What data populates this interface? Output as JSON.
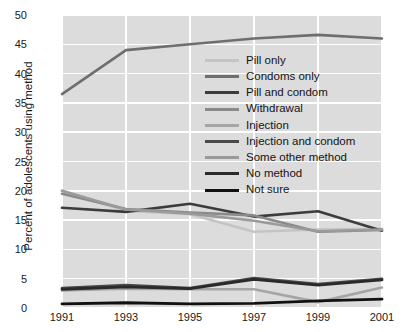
{
  "chart_data": {
    "type": "line",
    "title": "",
    "xlabel": "",
    "ylabel": "Percent of adolescents using method",
    "x": [
      1991,
      1993,
      1995,
      1997,
      1999,
      2001
    ],
    "xticklabels": [
      "1991",
      "1993",
      "1995",
      "1997",
      "1999",
      "2001"
    ],
    "yticklabels": [
      "0",
      "5",
      "10",
      "15",
      "20",
      "25",
      "30",
      "35",
      "40",
      "45",
      "50"
    ],
    "ylim": [
      0,
      50
    ],
    "ytick_step": 5,
    "xlim": [
      1991,
      2001
    ],
    "grid": true,
    "legend_position": "center-right",
    "plot_background": "#dcdcdc",
    "gridline_color": "#ffffff",
    "series": [
      {
        "name": "Pill only",
        "color": "#c4c4c4",
        "width": 2.6,
        "values": [
          20.0,
          16.6,
          16.0,
          13.0,
          13.4,
          13.5
        ]
      },
      {
        "name": "Condoms only",
        "color": "#6e6e6e",
        "width": 2.6,
        "values": [
          36.5,
          44.0,
          45.0,
          46.0,
          46.6,
          46.0
        ]
      },
      {
        "name": "Pill and condom",
        "color": "#3c3c3c",
        "width": 2.6,
        "values": [
          17.1,
          16.4,
          17.8,
          15.6,
          16.5,
          13.2
        ]
      },
      {
        "name": "Withdrawal",
        "color": "#8a8a8a",
        "width": 2.6,
        "values": [
          19.5,
          16.9,
          16.3,
          15.8,
          13.0,
          13.3
        ]
      },
      {
        "name": "Injection",
        "color": "#a5a5a5",
        "width": 2.6,
        "values": [
          3.0,
          3.3,
          3.2,
          3.2,
          1.0,
          3.5
        ]
      },
      {
        "name": "Injection and condom",
        "color": "#4a4a4a",
        "width": 2.6,
        "values": [
          3.4,
          3.9,
          3.4,
          5.1,
          4.1,
          5.0
        ]
      },
      {
        "name": "Some other method",
        "color": "#9a9a9a",
        "width": 2.6,
        "values": [
          20.0,
          16.8,
          16.1,
          14.9,
          13.1,
          13.4
        ]
      },
      {
        "name": "No method",
        "color": "#2a2a2a",
        "width": 2.8,
        "values": [
          3.2,
          3.6,
          3.3,
          4.9,
          3.9,
          4.8
        ]
      },
      {
        "name": "Not sure",
        "color": "#111111",
        "width": 2.8,
        "values": [
          0.7,
          0.9,
          0.7,
          0.8,
          1.2,
          1.5
        ]
      }
    ]
  }
}
